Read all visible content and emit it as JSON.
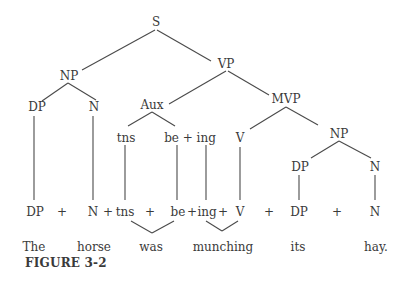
{
  "figure": {
    "caption": "FIGURE 3-2",
    "tree": {
      "S": "S",
      "NP": "NP",
      "VP": "VP",
      "NP_DP": "DP",
      "NP_N": "N",
      "Aux": "Aux",
      "MVP": "MVP",
      "Aux_tns": "tns",
      "Aux_be_ing": "be + ing",
      "MVP_V": "V",
      "MVP_NP": "NP",
      "MVP_NP_DP": "DP",
      "MVP_NP_N": "N"
    },
    "terminal_string": [
      "DP",
      "+",
      "N",
      "+",
      "tns",
      "+",
      "be",
      "+",
      "ing",
      "+",
      "V",
      "+",
      "DP",
      "+",
      "N"
    ],
    "sentence": [
      "The",
      "horse",
      "was",
      "munching",
      "its",
      "hay."
    ]
  }
}
